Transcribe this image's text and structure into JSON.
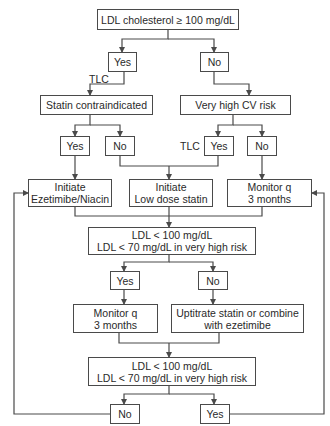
{
  "diagram": {
    "type": "flowchart",
    "nodes": {
      "start": {
        "line1": "LDL cholesterol ≥ 100 mg/dL"
      },
      "yes1": {
        "line1": "Yes"
      },
      "no1": {
        "line1": "No"
      },
      "statin_ci": {
        "line1": "Statin contraindicated"
      },
      "cv_risk": {
        "line1": "Very high CV risk"
      },
      "yes2": {
        "line1": "Yes"
      },
      "no2": {
        "line1": "No"
      },
      "yes3": {
        "line1": "Yes"
      },
      "no3": {
        "line1": "No"
      },
      "ezetimibe": {
        "line1": "Initiate",
        "line2": "Ezetimibe/Niacin"
      },
      "low_dose": {
        "line1": "Initiate",
        "line2": "Low dose statin"
      },
      "monitor1": {
        "line1": "Monitor q",
        "line2": "3 months"
      },
      "ldl_check1": {
        "line1": "LDL < 100 mg/dL",
        "line2": "LDL < 70 mg/dL in very high risk"
      },
      "yes4": {
        "line1": "Yes"
      },
      "no4": {
        "line1": "No"
      },
      "monitor2": {
        "line1": "Monitor q",
        "line2": "3 months"
      },
      "uptitrate": {
        "line1": "Uptitrate statin or combine",
        "line2": "with ezetimibe"
      },
      "ldl_check2": {
        "line1": "LDL < 100 mg/dL",
        "line2": "LDL < 70 mg/dL in very high risk"
      },
      "no5": {
        "line1": "No"
      },
      "yes5": {
        "line1": "Yes"
      }
    },
    "edge_labels": {
      "tlc_left": "TLC",
      "tlc_right": "TLC"
    },
    "colors": {
      "line": "#4a4a4a",
      "text": "#2a2a2a",
      "background": "#ffffff"
    }
  }
}
